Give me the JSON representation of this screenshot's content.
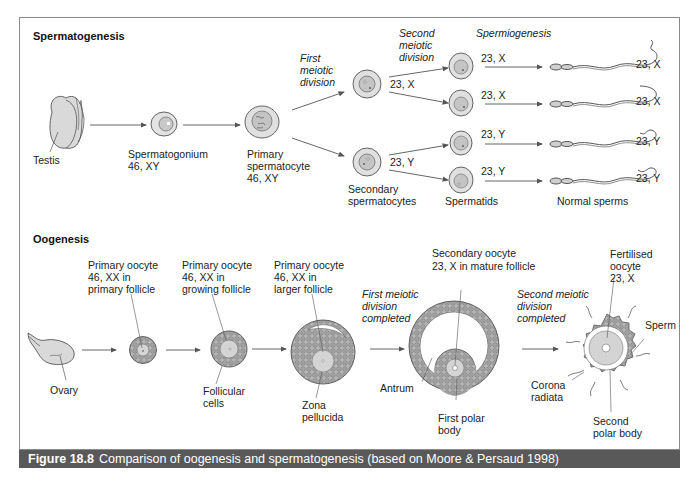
{
  "figure": {
    "number": "Figure 18.8",
    "caption": "Comparison of oogenesis and spermatogenesis (based on Moore & Persaud 1998)"
  },
  "spermatogenesis": {
    "title": "Spermatogenesis",
    "testis": "Testis",
    "spermatogonium": [
      "Spermatogonium",
      "46, XY"
    ],
    "primary_spermatocyte": [
      "Primary",
      "spermatocyte",
      "46, XY"
    ],
    "first_meiotic_division": [
      "First",
      "meiotic",
      "division"
    ],
    "second_meiotic_division": [
      "Second",
      "meiotic",
      "division"
    ],
    "spermiogenesis": "Spermiogenesis",
    "secondary_spermatocytes": [
      "Secondary",
      "spermatocytes"
    ],
    "secondary_labels": [
      "23, X",
      "23, Y"
    ],
    "spermatids_label": "Spermatids",
    "spermatid_labels": [
      "23, X",
      "23, X",
      "23, Y",
      "23, Y"
    ],
    "normal_sperms_label": "Normal sperms",
    "sperm_labels": [
      "23, X",
      "23, X",
      "23, Y",
      "23, Y"
    ]
  },
  "oogenesis": {
    "title": "Oogenesis",
    "ovary": "Ovary",
    "primary_follicle": [
      "Primary oocyte",
      "46, XX in",
      "primary follicle"
    ],
    "growing_follicle": [
      "Primary oocyte",
      "46, XX in",
      "growing follicle"
    ],
    "larger_follicle": [
      "Primary oocyte",
      "46, XX in",
      "larger follicle"
    ],
    "follicular_cells": [
      "Follicular",
      "cells"
    ],
    "zona_pellucida": [
      "Zona",
      "pellucida"
    ],
    "first_meiotic_completed": [
      "First meiotic",
      "division",
      "completed"
    ],
    "secondary_oocyte": [
      "Secondary oocyte",
      "23, X in mature follicle"
    ],
    "antrum": "Antrum",
    "first_polar_body": [
      "First polar",
      "body"
    ],
    "second_meiotic_completed": [
      "Second meiotic",
      "division",
      "completed"
    ],
    "fertilised_oocyte": [
      "Fertilised",
      "oocyte",
      "23, X"
    ],
    "sperm": "Sperm",
    "corona_radiata": [
      "Corona",
      "radiata"
    ],
    "second_polar_body": [
      "Second",
      "polar body"
    ]
  },
  "colors": {
    "cell_fill": "#d9d9d9",
    "cell_stroke": "#555555",
    "granulosa_fill": "#a9a9a9",
    "caption_bg": "#595959",
    "frame": "#8a8a8a"
  }
}
